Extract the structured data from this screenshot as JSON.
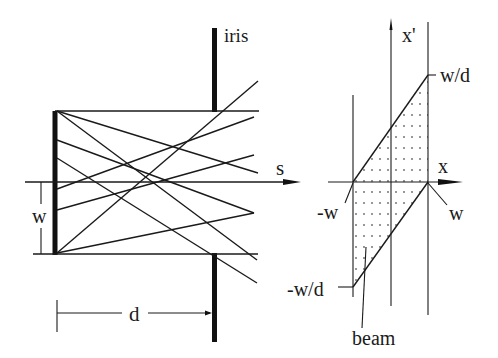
{
  "left_panel": {
    "title": "real space (ray diagram)",
    "labels": {
      "iris": "iris",
      "s_axis": "s",
      "width": "w",
      "distance": "d"
    },
    "source": {
      "x": 55,
      "y_top": 111,
      "y_bottom": 254
    },
    "iris": {
      "x": 214.5,
      "upper": [
        28,
        111
      ],
      "lower": [
        253,
        341
      ]
    },
    "aperture_lines": {
      "top_y": 111,
      "bottom_y": 254,
      "x_start": 55,
      "x_end": 258
    },
    "s_axis": {
      "y": 182,
      "x_start": 25,
      "x_end": 300
    },
    "rays": [
      {
        "from": [
          57,
          111
        ],
        "to": [
          258,
          173
        ]
      },
      {
        "from": [
          57,
          111
        ],
        "to": [
          257,
          260
        ]
      },
      {
        "from": [
          57,
          140
        ],
        "to": [
          254,
          213
        ]
      },
      {
        "from": [
          57,
          158
        ],
        "to": [
          257,
          283
        ]
      },
      {
        "from": [
          57,
          189
        ],
        "to": [
          254,
          117
        ]
      },
      {
        "from": [
          57,
          210
        ],
        "to": [
          254,
          155
        ]
      },
      {
        "from": [
          57,
          253
        ],
        "to": [
          258,
          81
        ]
      },
      {
        "from": [
          57,
          253
        ],
        "to": [
          254,
          213
        ]
      }
    ]
  },
  "right_panel": {
    "title": "phase space",
    "labels": {
      "x_axis": "x",
      "xp_axis": "x'",
      "plus_w": "w",
      "minus_w": "-w",
      "plus_wd": "w/d",
      "minus_wd": "-w/d",
      "beam": "beam"
    },
    "x_axis": {
      "y": 182,
      "x_start": 328,
      "x_end": 462
    },
    "xp_axis": {
      "x": 391,
      "y_top": 20,
      "y_bottom": 306
    },
    "left_boundary": {
      "x": 353,
      "y_top": 95,
      "y_bottom": 297
    },
    "right_boundary": {
      "x": 428,
      "y_top": 22,
      "y_bottom": 315
    },
    "parallelogram": [
      [
        353,
        182
      ],
      [
        428,
        75
      ],
      [
        428,
        182
      ],
      [
        353,
        287
      ]
    ]
  },
  "colors": {
    "ink": "#1a1a1a",
    "dots": "#666666",
    "background": "#ffffff"
  }
}
